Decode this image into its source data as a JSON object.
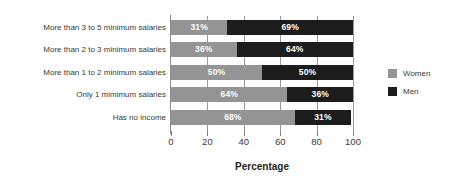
{
  "chart_data": {
    "type": "bar",
    "orientation": "horizontal",
    "stacked": true,
    "title": "",
    "xlabel": "Percentage",
    "ylabel": "",
    "xlim": [
      0,
      100
    ],
    "xticks": [
      "0",
      "20",
      "40",
      "60",
      "80",
      "100"
    ],
    "grid": true,
    "legend_position": "right",
    "categories": [
      "More than 3 to 5 minimum salaries",
      "More than 2 to 3 minimum salaries",
      "More than 1 to 2 minimum salaries",
      "Only 1 mimimum salaries",
      "Has no income"
    ],
    "series": [
      {
        "name": "Women",
        "color": "#949494",
        "values": [
          31,
          36,
          50,
          64,
          68
        ],
        "labels": [
          "31%",
          "36%",
          "50%",
          "64%",
          "68%"
        ]
      },
      {
        "name": "Men",
        "color": "#1c1c1c",
        "values": [
          69,
          64,
          50,
          36,
          31
        ],
        "labels": [
          "69%",
          "64%",
          "50%",
          "36%",
          "31%"
        ]
      }
    ]
  },
  "legend": {
    "items": [
      {
        "label": "Women",
        "color": "#949494"
      },
      {
        "label": "Men",
        "color": "#1c1c1c"
      }
    ]
  },
  "axis": {
    "x_title": "Percentage"
  }
}
